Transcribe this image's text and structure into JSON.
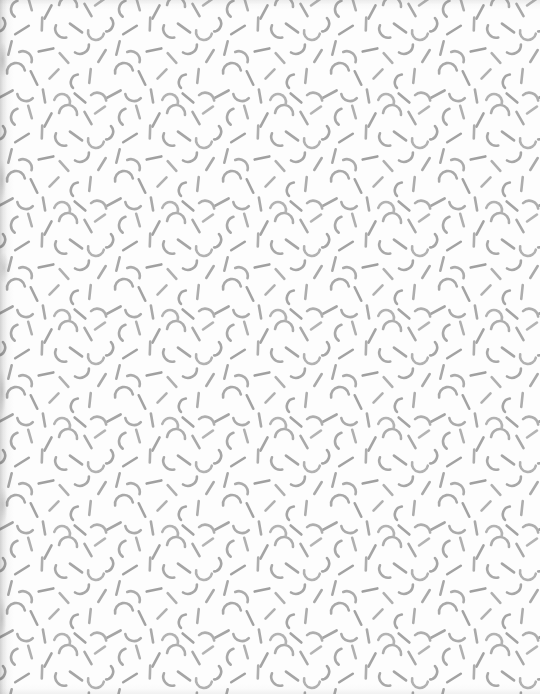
{
  "canvas": {
    "width": 540,
    "height": 694,
    "background_color": "#fdfdfd",
    "description": "Seamless memphis-style confetti pattern of short gray strokes on near-white paper"
  },
  "pattern": {
    "name": "confetti-stroke-pattern",
    "tile_width": 108,
    "tile_height": 108,
    "stroke_color": "#a9a9a9",
    "stroke_color_light": "#bdbdbd",
    "stroke_color_dark": "#9a9a9a",
    "stroke_width": 2.6,
    "stroke_linecap": "round",
    "motif_types": [
      "line-segment",
      "c-arc",
      "u-arc"
    ],
    "motifs": [
      {
        "type": "c-arc",
        "x": 12,
        "y": 8,
        "rotation": 10,
        "size": 9,
        "tone": "#a9a9a9"
      },
      {
        "type": "line-segment",
        "x": 30,
        "y": 4,
        "rotation": 74,
        "size": 13,
        "tone": "#b0b0b0"
      },
      {
        "type": "line-segment",
        "x": 48,
        "y": 12,
        "rotation": 118,
        "size": 15,
        "tone": "#a4a4a4"
      },
      {
        "type": "u-arc",
        "x": 68,
        "y": 6,
        "rotation": 186,
        "size": 9,
        "tone": "#adadad"
      },
      {
        "type": "line-segment",
        "x": 88,
        "y": 10,
        "rotation": 60,
        "size": 14,
        "tone": "#a9a9a9"
      },
      {
        "type": "line-segment",
        "x": 100,
        "y": 2,
        "rotation": 145,
        "size": 12,
        "tone": "#b4b4b4"
      },
      {
        "type": "c-arc",
        "x": 4,
        "y": 26,
        "rotation": 200,
        "size": 8,
        "tone": "#a6a6a6"
      },
      {
        "type": "line-segment",
        "x": 22,
        "y": 30,
        "rotation": 148,
        "size": 16,
        "tone": "#a2a2a2"
      },
      {
        "type": "line-segment",
        "x": 42,
        "y": 24,
        "rotation": 92,
        "size": 13,
        "tone": "#aeaeae"
      },
      {
        "type": "c-arc",
        "x": 58,
        "y": 34,
        "rotation": 320,
        "size": 9,
        "tone": "#a9a9a9"
      },
      {
        "type": "line-segment",
        "x": 76,
        "y": 28,
        "rotation": 36,
        "size": 15,
        "tone": "#a5a5a5"
      },
      {
        "type": "u-arc",
        "x": 96,
        "y": 32,
        "rotation": 12,
        "size": 8,
        "tone": "#b2b2b2"
      },
      {
        "type": "line-segment",
        "x": 10,
        "y": 48,
        "rotation": 104,
        "size": 14,
        "tone": "#a8a8a8"
      },
      {
        "type": "c-arc",
        "x": 28,
        "y": 54,
        "rotation": 130,
        "size": 9,
        "tone": "#acacac"
      },
      {
        "type": "line-segment",
        "x": 46,
        "y": 50,
        "rotation": 168,
        "size": 15,
        "tone": "#a0a0a0"
      },
      {
        "type": "line-segment",
        "x": 64,
        "y": 58,
        "rotation": 48,
        "size": 13,
        "tone": "#b0b0b0"
      },
      {
        "type": "c-arc",
        "x": 84,
        "y": 52,
        "rotation": 240,
        "size": 9,
        "tone": "#a7a7a7"
      },
      {
        "type": "line-segment",
        "x": 102,
        "y": 56,
        "rotation": 122,
        "size": 14,
        "tone": "#aaaaaa"
      },
      {
        "type": "u-arc",
        "x": 16,
        "y": 72,
        "rotation": 170,
        "size": 9,
        "tone": "#a9a9a9"
      },
      {
        "type": "line-segment",
        "x": 34,
        "y": 78,
        "rotation": 64,
        "size": 15,
        "tone": "#a3a3a3"
      },
      {
        "type": "line-segment",
        "x": 54,
        "y": 74,
        "rotation": 134,
        "size": 13,
        "tone": "#b1b1b1"
      },
      {
        "type": "c-arc",
        "x": 72,
        "y": 80,
        "rotation": 20,
        "size": 8,
        "tone": "#a6a6a6"
      },
      {
        "type": "line-segment",
        "x": 90,
        "y": 76,
        "rotation": 96,
        "size": 14,
        "tone": "#adadad"
      },
      {
        "type": "line-segment",
        "x": 6,
        "y": 94,
        "rotation": 152,
        "size": 15,
        "tone": "#a5a5a5"
      },
      {
        "type": "c-arc",
        "x": 24,
        "y": 100,
        "rotation": 285,
        "size": 9,
        "tone": "#ababab"
      },
      {
        "type": "line-segment",
        "x": 44,
        "y": 96,
        "rotation": 80,
        "size": 13,
        "tone": "#a9a9a9"
      },
      {
        "type": "u-arc",
        "x": 62,
        "y": 102,
        "rotation": 195,
        "size": 8,
        "tone": "#b3b3b3"
      },
      {
        "type": "line-segment",
        "x": 80,
        "y": 98,
        "rotation": 40,
        "size": 14,
        "tone": "#a4a4a4"
      },
      {
        "type": "c-arc",
        "x": 100,
        "y": 94,
        "rotation": 110,
        "size": 9,
        "tone": "#aeaeae"
      }
    ]
  },
  "artifacts": {
    "left_edge_shadow": "vertical gray scan smudge along left margin",
    "top_edge_shadow": "faint gray clipped strokes along top margin",
    "bottom_edge_shadow": "faint gray clipped strokes along bottom margin"
  }
}
